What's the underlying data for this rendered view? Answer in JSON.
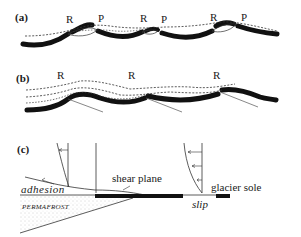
{
  "figure": {
    "panels": [
      {
        "id": "a",
        "label": "(a)",
        "markers": [
          "R",
          "P",
          "R",
          "P",
          "R",
          "P"
        ]
      },
      {
        "id": "b",
        "label": "(b)",
        "markers": [
          "R",
          "R",
          "R"
        ]
      },
      {
        "id": "c",
        "label": "(c)",
        "annotations": {
          "shear_plane": "shear plane",
          "glacier_sole": "glacier sole",
          "adhesion": "adhesion",
          "permafrost": "PERMAFROST",
          "slip": "slip"
        }
      }
    ],
    "colors": {
      "ink": "#111111",
      "line": "#333333",
      "stipple": "#999999",
      "background": "#ffffff"
    }
  }
}
